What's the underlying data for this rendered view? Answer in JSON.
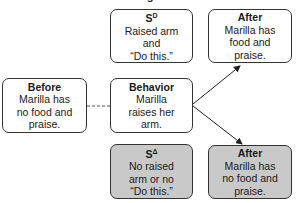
{
  "title_fragment": "g",
  "boxes": {
    "sd": {
      "head": "S",
      "head_sup": "D",
      "lines": [
        "Raised arm",
        "and",
        "“Do this.”"
      ]
    },
    "after_top": {
      "head": "After",
      "lines": [
        "Marilla has",
        "food and",
        "praise."
      ]
    },
    "before": {
      "head": "Before",
      "lines": [
        "Marilla has",
        "no food and",
        "praise."
      ]
    },
    "behavior": {
      "head": "Behavior",
      "lines": [
        "Marilla",
        "raises her",
        "arm."
      ]
    },
    "sdelta": {
      "head": "S",
      "head_sup": "Δ",
      "lines": [
        "No raised",
        "arm or no",
        "“Do this.”"
      ]
    },
    "after_bottom": {
      "head": "After",
      "lines": [
        "Marilla has",
        "no food and",
        "praise."
      ]
    }
  },
  "colors": {
    "border": "#333333",
    "gray_fill": "#c9c9c9",
    "white_fill": "#ffffff"
  }
}
